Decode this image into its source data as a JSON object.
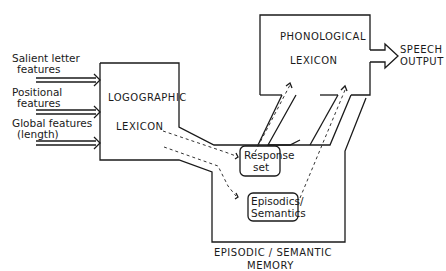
{
  "inputs": [
    {
      "line1": "Salient letter",
      "line2": "features"
    },
    {
      "line1": "Positional",
      "line2": "features"
    },
    {
      "line1": "Global features",
      "line2": "(length)"
    }
  ],
  "logographic": {
    "line1": "LOGOGRAPHIC",
    "line2": "LEXICON"
  },
  "phonological": {
    "line1": "PHONOLOGICAL",
    "line2": "LEXICON"
  },
  "output": {
    "line1": "SPEECH",
    "line2": "OUTPUT"
  },
  "response_set": {
    "line1": "Response",
    "line2": "set"
  },
  "episodics": {
    "line1": "Episodics/",
    "line2": "Semantics"
  },
  "memory": {
    "line1": "EPISODIC / SEMANTIC",
    "line2": "MEMORY"
  },
  "colors": {
    "ink": "#1a1a1a",
    "background": "#ffffff"
  }
}
